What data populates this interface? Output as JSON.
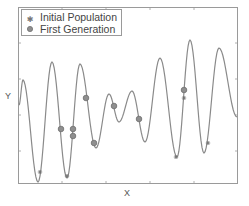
{
  "chart_data": {
    "type": "line",
    "title": "",
    "xlabel": "X",
    "ylabel": "Y",
    "grid": false,
    "legend_position": "upper left",
    "legend": [
      "Initial Population",
      "First Generation"
    ],
    "colors": {
      "curve": "#8a8a8a",
      "frame": "#9a9a9a",
      "marker_fill": "#8f8f8f",
      "marker_edge": "#6f6f6f",
      "text": "#555555"
    },
    "series": [
      {
        "name": "Objective function",
        "style": "line",
        "points_px": [
          [
            19,
            105
          ],
          [
            23,
            80
          ],
          [
            38,
            182
          ],
          [
            52,
            62
          ],
          [
            67,
            178
          ],
          [
            80,
            64
          ],
          [
            96,
            148
          ],
          [
            109,
            94
          ],
          [
            119,
            122
          ],
          [
            132,
            91
          ],
          [
            145,
            142
          ],
          [
            160,
            58
          ],
          [
            177,
            157
          ],
          [
            190,
            40
          ],
          [
            204,
            153
          ],
          [
            219,
            48
          ],
          [
            237,
            117
          ]
        ]
      },
      {
        "name": "Initial Population",
        "style": "star",
        "points_px": [
          [
            40,
            172
          ],
          [
            67,
            176
          ],
          [
            184,
            98
          ],
          [
            176,
            157
          ],
          [
            208,
            143
          ]
        ]
      },
      {
        "name": "First Generation",
        "style": "circle",
        "points_px": [
          [
            61,
            129
          ],
          [
            73,
            129
          ],
          [
            73,
            136
          ],
          [
            86,
            98
          ],
          [
            94,
            143
          ],
          [
            114,
            106
          ],
          [
            139,
            119
          ],
          [
            184,
            90
          ]
        ]
      }
    ]
  },
  "axes": {
    "x_label": "X",
    "y_label": "Y"
  },
  "legend": {
    "items": [
      {
        "label": "Initial Population",
        "marker": "star"
      },
      {
        "label": "First Generation",
        "marker": "circle"
      }
    ]
  }
}
